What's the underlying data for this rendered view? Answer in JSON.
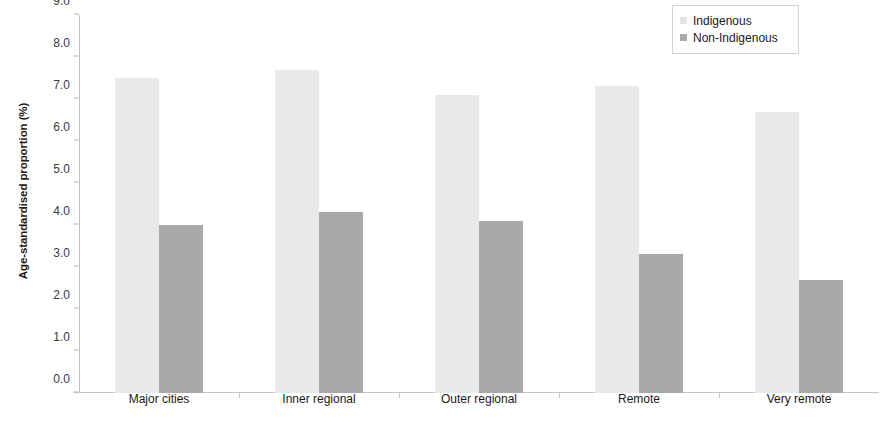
{
  "chart_data": {
    "type": "bar",
    "title": "",
    "subtitle": "",
    "xlabel": "",
    "ylabel": "Age-standardised proportion (%)",
    "categories": [
      "Major cities",
      "Inner regional",
      "Outer regional",
      "Remote",
      "Very remote"
    ],
    "series": [
      {
        "name": "Indigenous",
        "color": "#e9e9e9",
        "values": [
          7.5,
          7.7,
          7.1,
          7.3,
          6.7
        ]
      },
      {
        "name": "Non-Indigenous",
        "color": "#a9a9a9",
        "values": [
          4.0,
          4.3,
          4.1,
          3.3,
          2.7
        ]
      }
    ],
    "ylim": [
      0.0,
      9.0
    ],
    "ytick_step": 1.0,
    "ytick_labels": [
      "0.0",
      "1.0",
      "2.0",
      "3.0",
      "4.0",
      "5.0",
      "6.0",
      "7.0",
      "8.0",
      "9.0"
    ],
    "grid": false,
    "legend_position": "top-right"
  },
  "legend": {
    "items": [
      {
        "label": "Indigenous",
        "swatch": "legend-swatch-indigenous"
      },
      {
        "label": "Non-Indigenous",
        "swatch": "legend-swatch-non-indigenous"
      }
    ]
  }
}
